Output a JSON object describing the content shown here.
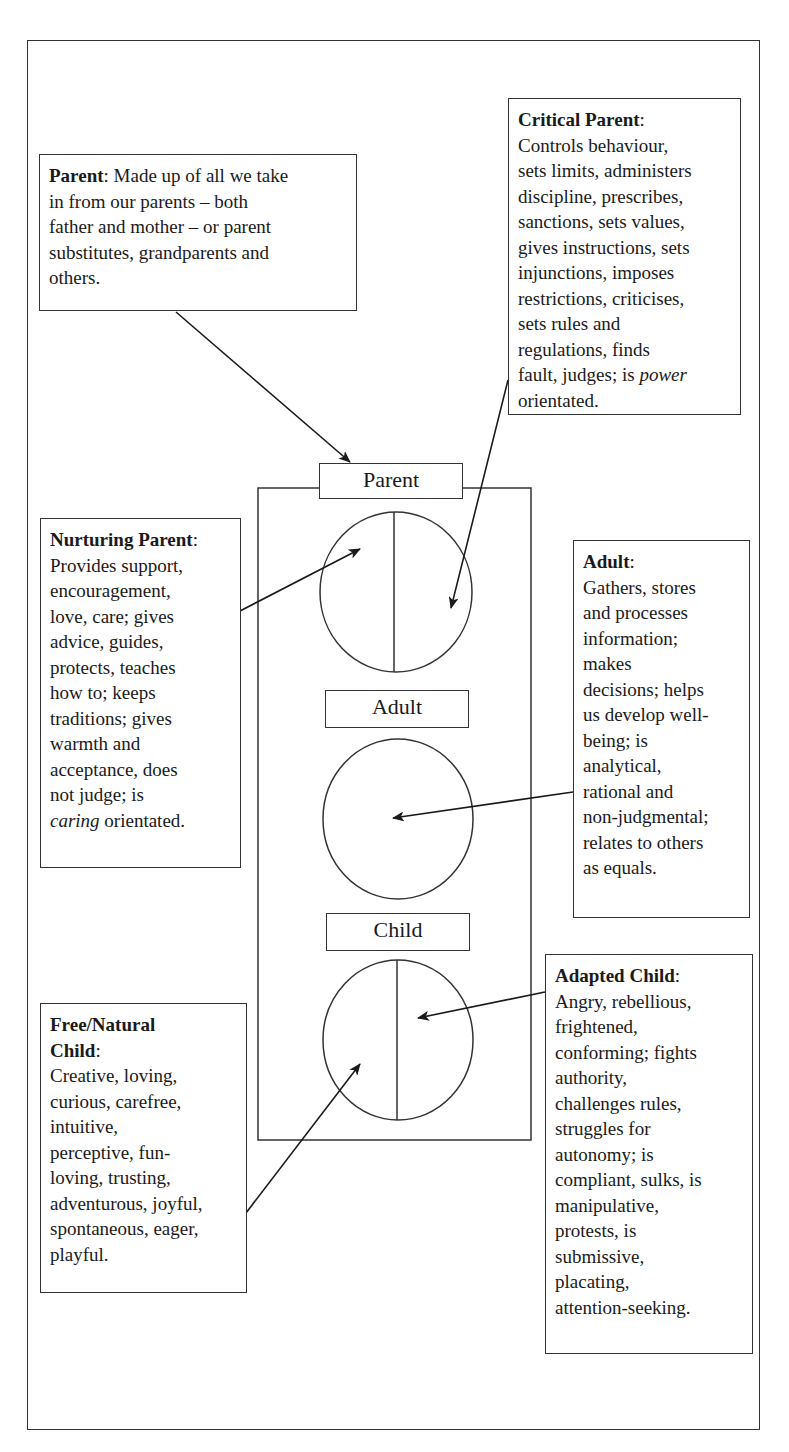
{
  "diagram": {
    "ego_state_labels": {
      "parent": "Parent",
      "adult": "Adult",
      "child": "Child"
    },
    "boxes": {
      "parent": {
        "heading": "Parent",
        "lines": [
          "in from our parents – both",
          "father and mother – or parent",
          "substitutes, grandparents and",
          "others."
        ],
        "first_line_rest": ": Made up of all we take"
      },
      "critical_parent": {
        "heading": "Critical Parent",
        "after_heading": ":",
        "lines": [
          "Controls behaviour,",
          "sets limits, administers",
          "discipline, prescribes,",
          "sanctions, sets values,",
          "gives instructions, sets",
          "injunctions, imposes",
          "restrictions, criticises,",
          "sets rules and",
          "regulations, finds"
        ],
        "last_line_pre": "fault, judges; is ",
        "last_line_italic": "power",
        "final_line": "orientated."
      },
      "nurturing_parent": {
        "heading": "Nurturing Parent",
        "after_heading": ":",
        "lines": [
          "Provides support,",
          "encouragement,",
          "love, care; gives",
          "advice, guides,",
          "protects, teaches",
          "how to; keeps",
          "traditions; gives",
          "warmth and",
          "acceptance, does",
          "not judge; is"
        ],
        "last_line_italic": "caring",
        "last_line_rest": " orientated."
      },
      "adult": {
        "heading": "Adult",
        "after_heading": ":",
        "lines": [
          "Gathers, stores",
          "and processes",
          "information;",
          "makes",
          "decisions; helps",
          "us develop well-",
          "being; is",
          "analytical,",
          "rational and",
          "non-judgmental;",
          "relates to others",
          "as equals."
        ]
      },
      "free_child": {
        "heading_line1": "Free/Natural",
        "heading_line2": "Child",
        "after_heading": ":",
        "lines": [
          "Creative, loving,",
          "curious, carefree,",
          "intuitive,",
          "perceptive, fun-",
          "loving, trusting,",
          "adventurous, joyful,",
          "spontaneous, eager,",
          "playful."
        ]
      },
      "adapted_child": {
        "heading": "Adapted Child",
        "after_heading": ":",
        "lines": [
          "Angry, rebellious,",
          "frightened,",
          "conforming; fights",
          "authority,",
          "challenges rules,",
          "struggles for",
          "autonomy; is",
          "compliant, sulks, is",
          "manipulative,",
          "protests, is",
          "submissive,",
          "placating,",
          "attention-seeking."
        ]
      }
    },
    "colors": {
      "line": "#333333",
      "text": "#1a1a1a",
      "background": "#ffffff"
    }
  }
}
